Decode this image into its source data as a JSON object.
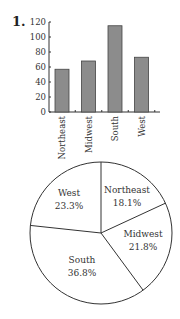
{
  "problem_number": "1.",
  "chart_data": [
    {
      "type": "bar",
      "title": "",
      "xlabel": "",
      "ylabel": "",
      "categories": [
        "Northeast",
        "Midwest",
        "South",
        "West"
      ],
      "values": [
        57,
        68,
        115,
        73
      ],
      "ylim": [
        0,
        120
      ],
      "yticks": [
        0,
        20,
        40,
        60,
        80,
        100,
        120
      ],
      "grid": false,
      "legend": null,
      "bar_color": "#8c8c8c",
      "bar_edge_color": "#444444"
    },
    {
      "type": "pie",
      "title": "",
      "slices": [
        {
          "label": "Northeast",
          "percent": 18.1,
          "display": "18.1%"
        },
        {
          "label": "Midwest",
          "percent": 21.8,
          "display": "21.8%"
        },
        {
          "label": "South",
          "percent": 36.8,
          "display": "36.8%"
        },
        {
          "label": "West",
          "percent": 23.3,
          "display": "23.3%"
        }
      ],
      "start_angle_deg": 0,
      "direction": "clockwise",
      "fill_color": "#ffffff",
      "edge_color": "#333333"
    }
  ]
}
